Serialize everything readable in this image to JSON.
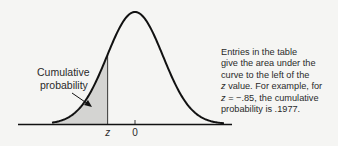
{
  "diagram": {
    "type": "normal-distribution-cumulative",
    "shaded_region_label_line1": "Cumulative",
    "shaded_region_label_line2": "probability",
    "x_axis_label_z": "z",
    "x_axis_label_zero": "0",
    "z_value_shown": -0.85,
    "cumulative_probability": 0.1977
  },
  "colors": {
    "background": "#f5f5f3",
    "curve": "#111111",
    "shade": "#d4d4d2",
    "text": "#2a2a2a"
  },
  "note": {
    "lines": [
      "Entries in the table",
      "give the area under the",
      "curve to the left of the",
      " value. For example, for",
      " = −.85, the cumulative",
      "probability is .1977."
    ],
    "z_symbol": "z"
  }
}
